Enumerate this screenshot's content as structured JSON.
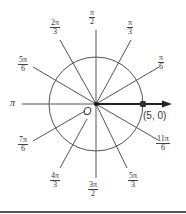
{
  "diagram": {
    "origin_label": "O",
    "pole_axis_left_label": "π",
    "point": {
      "label": "(5, 0)",
      "r": 5,
      "theta": 0
    },
    "colors": {
      "lines": "#444444",
      "text": "#333333",
      "point": "#333333"
    },
    "angles": [
      {
        "id": "pi-6",
        "num": "π",
        "den": "6"
      },
      {
        "id": "pi-3",
        "num": "π",
        "den": "3"
      },
      {
        "id": "pi-2",
        "num": "π",
        "den": "2"
      },
      {
        "id": "2pi-3",
        "num": "2π",
        "den": "3"
      },
      {
        "id": "5pi-6",
        "num": "5π",
        "den": "6"
      },
      {
        "id": "7pi-6",
        "num": "7π",
        "den": "6"
      },
      {
        "id": "4pi-3",
        "num": "4π",
        "den": "3"
      },
      {
        "id": "3pi-2",
        "num": "3π",
        "den": "2"
      },
      {
        "id": "5pi-3",
        "num": "5π",
        "den": "3"
      },
      {
        "id": "11pi-6",
        "num": "11π",
        "den": "6"
      }
    ]
  }
}
